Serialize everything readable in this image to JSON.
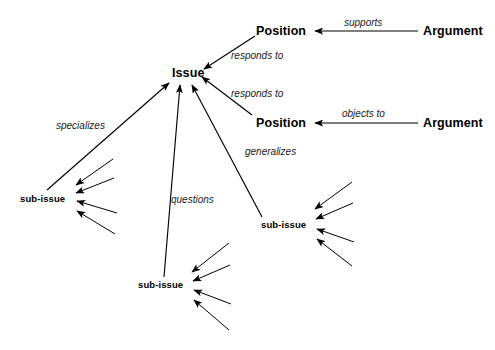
{
  "diagram": {
    "background_color": "#ffffff",
    "line_color": "#000000",
    "nodes": [
      {
        "id": "issue",
        "label": "Issue",
        "type": "primary",
        "x": 172,
        "y": 67
      },
      {
        "id": "position-1",
        "label": "Position",
        "type": "primary",
        "x": 256,
        "y": 25
      },
      {
        "id": "position-2",
        "label": "Position",
        "type": "primary",
        "x": 256,
        "y": 117
      },
      {
        "id": "argument-1",
        "label": "Argument",
        "type": "primary",
        "x": 423,
        "y": 25
      },
      {
        "id": "argument-2",
        "label": "Argument",
        "type": "primary",
        "x": 423,
        "y": 117
      },
      {
        "id": "sub-issue-left",
        "label": "sub-issue",
        "type": "sub",
        "x": 20,
        "y": 194
      },
      {
        "id": "sub-issue-bottom",
        "label": "sub-issue",
        "type": "sub",
        "x": 138,
        "y": 280
      },
      {
        "id": "sub-issue-right",
        "label": "sub-issue",
        "type": "sub",
        "x": 261,
        "y": 220
      }
    ],
    "edge_labels": [
      {
        "id": "supports",
        "label": "supports",
        "x": 344,
        "y": 18
      },
      {
        "id": "objects-to",
        "label": "objects to",
        "x": 342,
        "y": 109
      },
      {
        "id": "responds-to-1",
        "label": "responds to",
        "x": 231,
        "y": 51
      },
      {
        "id": "responds-to-2",
        "label": "responds to",
        "x": 231,
        "y": 89
      },
      {
        "id": "specializes",
        "label": "specializes",
        "x": 56,
        "y": 121
      },
      {
        "id": "questions",
        "label": "questions",
        "x": 171,
        "y": 195
      },
      {
        "id": "generalizes",
        "label": "generalizes",
        "x": 245,
        "y": 147
      }
    ],
    "relations": [
      {
        "from": "argument-1",
        "to": "position-1",
        "label": "supports"
      },
      {
        "from": "argument-2",
        "to": "position-2",
        "label": "objects to"
      },
      {
        "from": "position-1",
        "to": "issue",
        "label": "responds to"
      },
      {
        "from": "position-2",
        "to": "issue",
        "label": "responds to"
      },
      {
        "from": "sub-issue-left",
        "to": "issue",
        "label": "specializes"
      },
      {
        "from": "sub-issue-bottom",
        "to": "issue",
        "label": "questions"
      },
      {
        "from": "sub-issue-right",
        "to": "issue",
        "label": "generalizes"
      }
    ]
  }
}
